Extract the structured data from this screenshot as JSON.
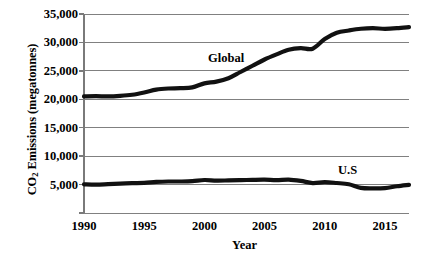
{
  "chart_data": {
    "type": "line",
    "title": "",
    "xlabel": "Year",
    "ylabel": "CO2 Emissions (megatonnes)",
    "ylabel_prefix": "CO",
    "ylabel_subscript": "2",
    "ylabel_suffix": " Emissions (megatonnes)",
    "xlim": [
      1990,
      2017
    ],
    "ylim": [
      0,
      35000
    ],
    "grid": true,
    "legend_position": "inline-annotation",
    "x_ticks": [
      1990,
      1995,
      2000,
      2005,
      2010,
      2015
    ],
    "x_tick_labels": [
      "1990",
      "1995",
      "2000",
      "2005",
      "2010",
      "2015"
    ],
    "y_ticks": [
      5000,
      10000,
      15000,
      20000,
      25000,
      30000,
      35000
    ],
    "y_tick_labels": [
      "5,000",
      "10,000",
      "15,000",
      "20,000",
      "25,000",
      "30,000",
      "35,000"
    ],
    "line_color": "#111111",
    "grid_color": "#808080",
    "axis_color": "#7a7a7a",
    "x": [
      1990,
      1991,
      1992,
      1993,
      1994,
      1995,
      1996,
      1997,
      1998,
      1999,
      2000,
      2001,
      2002,
      2003,
      2004,
      2005,
      2006,
      2007,
      2008,
      2009,
      2010,
      2011,
      2012,
      2013,
      2014,
      2015,
      2016,
      2017
    ],
    "series": [
      {
        "name": "Global",
        "label": "Global",
        "values": [
          20500,
          20550,
          20500,
          20600,
          20800,
          21200,
          21700,
          21900,
          21950,
          22100,
          22800,
          23100,
          23700,
          24800,
          25900,
          27000,
          27900,
          28700,
          29000,
          28900,
          30600,
          31700,
          32100,
          32400,
          32500,
          32400,
          32500,
          32700
        ]
      },
      {
        "name": "U.S",
        "label": "U.S",
        "values": [
          5040,
          4990,
          5080,
          5180,
          5250,
          5300,
          5460,
          5540,
          5540,
          5600,
          5800,
          5700,
          5730,
          5770,
          5830,
          5860,
          5780,
          5870,
          5650,
          5270,
          5430,
          5280,
          5060,
          4420,
          4330,
          4390,
          4700,
          4960
        ]
      }
    ],
    "annotations": [
      {
        "text": "Global",
        "x": 2002,
        "y": 26800
      },
      {
        "text": "U.S",
        "x": 2011,
        "y": 8200
      }
    ]
  }
}
